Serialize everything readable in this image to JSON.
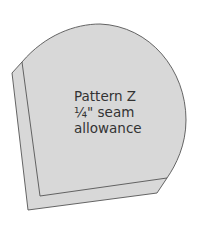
{
  "diagram": {
    "type": "sewing-pattern-piece",
    "label_lines": [
      "Pattern Z",
      "¼\" seam",
      "allowance"
    ],
    "colors": {
      "fill": "#d8d8d8",
      "outline": "#555555",
      "text": "#333333",
      "background": "#ffffff"
    }
  }
}
